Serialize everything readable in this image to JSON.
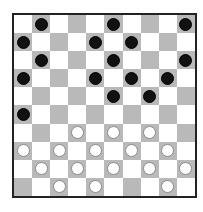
{
  "game": "draughts",
  "board": {
    "size": 10,
    "colors": {
      "light": "#ffffff",
      "dark": "#b9b9b9",
      "border": "#222222"
    },
    "rows": [
      [
        "",
        "b",
        "",
        "",
        "",
        "b",
        "",
        "",
        "",
        "b"
      ],
      [
        "b",
        "",
        "",
        "",
        "b",
        "",
        "b",
        "",
        "",
        ""
      ],
      [
        "",
        "b",
        "",
        "",
        "",
        "b",
        "",
        "",
        "",
        "b"
      ],
      [
        "b",
        "",
        "",
        "",
        "b",
        "",
        "b",
        "",
        "b",
        ""
      ],
      [
        "",
        "",
        "",
        "",
        "",
        "b",
        "",
        "b",
        "",
        ""
      ],
      [
        "b",
        "",
        "",
        "",
        "",
        "",
        "",
        "",
        "",
        ""
      ],
      [
        "",
        "",
        "",
        "w",
        "",
        "w",
        "",
        "w",
        "",
        ""
      ],
      [
        "w",
        "",
        "w",
        "",
        "w",
        "",
        "w",
        "",
        "w",
        ""
      ],
      [
        "",
        "w",
        "",
        "w",
        "",
        "w",
        "",
        "w",
        "",
        "w"
      ],
      [
        "",
        "",
        "w",
        "",
        "w",
        "",
        "",
        "",
        "w",
        ""
      ]
    ]
  },
  "pieces": {
    "black_count": 18,
    "white_count": 16
  }
}
